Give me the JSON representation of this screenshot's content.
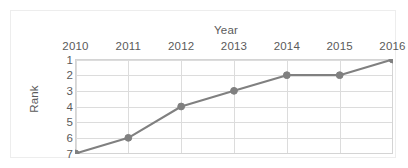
{
  "chart_data": {
    "type": "line",
    "title": "",
    "xlabel": "Year",
    "ylabel": "Rank",
    "categories": [
      "2010",
      "2011",
      "2012",
      "2013",
      "2014",
      "2015",
      "2016"
    ],
    "x": [
      2010,
      2011,
      2012,
      2013,
      2014,
      2015,
      2016
    ],
    "values": [
      7,
      6,
      4,
      3,
      2,
      2,
      1
    ],
    "series": [
      {
        "name": "Rank",
        "values": [
          7,
          6,
          4,
          3,
          2,
          2,
          1
        ]
      }
    ],
    "ytick_labels": [
      "1",
      "2",
      "3",
      "4",
      "5",
      "6",
      "7"
    ],
    "ytick_values": [
      1,
      2,
      3,
      4,
      5,
      6,
      7
    ],
    "ylim": [
      1,
      7
    ],
    "y_axis_inverted": true,
    "xlim": [
      2010,
      2016
    ],
    "grid": "horizontal-and-vertical",
    "legend": "none",
    "x_axis_position": "top",
    "series_color": "#808080",
    "grid_color": "#dcdcdc",
    "text_color": "#5a5a5a",
    "frame_color": "#ededed",
    "background_color": "#ffffff",
    "marker": "circle"
  }
}
